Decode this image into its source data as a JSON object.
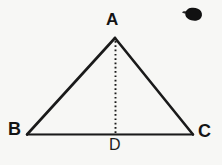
{
  "figure": {
    "kind": "geometry-diagram",
    "background_color": "#f7f7f5",
    "ink_color": "#141414",
    "vertices": {
      "A": {
        "label": "A",
        "x": 115,
        "y": 38
      },
      "B": {
        "label": "B",
        "x": 27,
        "y": 134
      },
      "C": {
        "label": "C",
        "x": 193,
        "y": 134
      },
      "D": {
        "label": "D",
        "x": 115,
        "y": 134
      }
    },
    "segments": [
      {
        "name": "AB",
        "from": "A",
        "to": "B",
        "style": "solid",
        "width": 2.6
      },
      {
        "name": "AC",
        "from": "A",
        "to": "C",
        "style": "solid",
        "width": 2.6
      },
      {
        "name": "BC",
        "from": "B",
        "to": "C",
        "style": "solid",
        "width": 2.2
      },
      {
        "name": "AD",
        "from": "A",
        "to": "D",
        "style": "dotted",
        "width": 1.9
      }
    ],
    "artifact": {
      "name": "ink-blob",
      "x": 185,
      "y": 8,
      "width": 17,
      "height": 13,
      "color": "#111111"
    }
  }
}
